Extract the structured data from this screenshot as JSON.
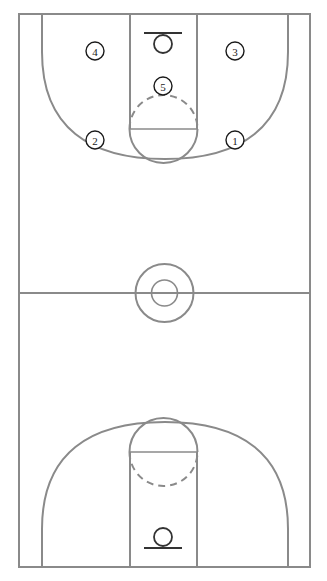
{
  "diagram": {
    "type": "basketball-court-full",
    "colors": {
      "background": "#ffffff",
      "court_line": "#8a8a8a",
      "hoop_line": "#333333",
      "player_marker_stroke": "#1a1a1a",
      "player_marker_fill": "#ffffff",
      "player_label_text": "#1a1a1a"
    },
    "geometry": {
      "court_left": 19,
      "court_right": 310,
      "court_top": 14,
      "court_bottom": 567,
      "half_court_y": 293,
      "center_circle_outer_r": 29,
      "center_circle_inner_r": 13,
      "lane_left": 130,
      "lane_right": 197,
      "top_free_throw_y": 129,
      "bottom_free_throw_y": 458,
      "free_throw_circle_r": 34,
      "three_point_corner_x_left": 42,
      "three_point_corner_x_right": 288,
      "three_point_straight_end_top_y": 52,
      "three_point_straight_end_bottom_y": 530,
      "top_hoop_y": 45,
      "bottom_hoop_y": 537,
      "hoop_r": 9,
      "backboard_half_width": 19
    }
  },
  "players": [
    {
      "id": "player-1",
      "label": "1",
      "cx": 235,
      "cy": 140,
      "r": 9,
      "role": "point-guard-right-wing"
    },
    {
      "id": "player-2",
      "label": "2",
      "cx": 95,
      "cy": 140,
      "r": 9,
      "role": "left-wing"
    },
    {
      "id": "player-3",
      "label": "3",
      "cx": 235,
      "cy": 51,
      "r": 9,
      "role": "right-corner-block"
    },
    {
      "id": "player-4",
      "label": "4",
      "cx": 95,
      "cy": 51,
      "r": 9,
      "role": "left-corner-block"
    },
    {
      "id": "player-5",
      "label": "5",
      "cx": 163,
      "cy": 86,
      "r": 9,
      "role": "high-post-center"
    }
  ],
  "hoops": [
    {
      "id": "hoop-top",
      "name": "top-basket",
      "cx": 163,
      "rim_cy": 45,
      "backboard_y": 33
    },
    {
      "id": "hoop-bottom",
      "name": "bottom-basket",
      "cx": 163,
      "rim_cy": 537,
      "backboard_y": 549
    }
  ]
}
